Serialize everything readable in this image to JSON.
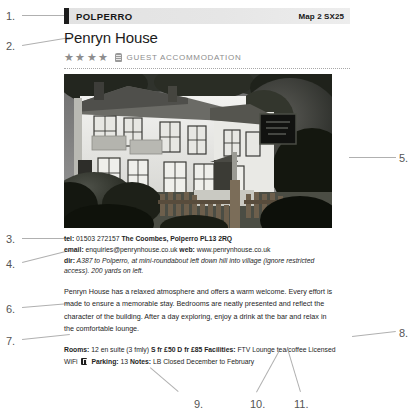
{
  "entry": {
    "town": "POLPERRO",
    "map_reference": "Map 2 SX25",
    "name": "Penryn House",
    "star_rating": 4,
    "stars_glyphs": "★★★★",
    "emblem_icon": "rosette-emblem-icon",
    "classification": "GUEST ACCOMMODATION",
    "photo_alt": "Black and white photograph of Penryn House, a white rendered Victorian guest house with bay windows, behind a wooden picket fence and hedge, with a dark sign board to the right",
    "contact": {
      "tel_label": "tel:",
      "tel_number": "01503 272157",
      "address": "The Coombes, Polperro PL13 2RQ",
      "email_label": "email:",
      "email": "enquiries@penrynhouse.co.uk",
      "web_label": "web:",
      "web": "www.penrynhouse.co.uk",
      "dir_label": "dir:",
      "directions": "A387 to Polperro, at mini-roundabout left down hill into village (ignore restricted access). 200 yards on left."
    },
    "description": "Penryn House has a relaxed atmosphere and offers a warm welcome. Every effort is made to ensure a memorable stay. Bedrooms are neatly presented and reflect the character of the building. After a day exploring, enjoy a drink at the bar and relax in the comfortable lounge.",
    "facilities": {
      "rooms_label": "Rooms:",
      "rooms_value": "12 en suite (3 fmly)",
      "single_rate": "S fr £50",
      "double_rate": "D fr £85",
      "facilities_label": "Facilities:",
      "facilities_value": "FTV Lounge tea/coffee Licensed WiFi",
      "parking_icon": "parking-icon",
      "parking_label": "Parking:",
      "parking_value": "13",
      "notes_label": "Notes:",
      "notes_value": "LB Closed December to February"
    }
  },
  "callouts": [
    {
      "id": "1",
      "label": "1.",
      "x": 6,
      "y": 10
    },
    {
      "id": "2",
      "label": "2.",
      "x": 6,
      "y": 40
    },
    {
      "id": "3",
      "label": "3.",
      "x": 6,
      "y": 233
    },
    {
      "id": "4",
      "label": "4.",
      "x": 6,
      "y": 258
    },
    {
      "id": "5",
      "label": "5.",
      "x": 399,
      "y": 152
    },
    {
      "id": "6",
      "label": "6.",
      "x": 6,
      "y": 303
    },
    {
      "id": "7",
      "label": "7.",
      "x": 6,
      "y": 335
    },
    {
      "id": "8",
      "label": "8.",
      "x": 399,
      "y": 327
    },
    {
      "id": "9",
      "label": "9.",
      "x": 194,
      "y": 398
    },
    {
      "id": "10",
      "label": "10.",
      "x": 250,
      "y": 398
    },
    {
      "id": "11",
      "label": "11.",
      "x": 294,
      "y": 398
    }
  ],
  "leaders": [
    {
      "name": "leader-1",
      "x1": 22,
      "y1": 15,
      "x2": 68,
      "y2": 15
    },
    {
      "name": "leader-2",
      "x1": 22,
      "y1": 45,
      "x2": 70,
      "y2": 37
    },
    {
      "name": "leader-3",
      "x1": 22,
      "y1": 238,
      "x2": 70,
      "y2": 238
    },
    {
      "name": "leader-4",
      "x1": 22,
      "y1": 262,
      "x2": 70,
      "y2": 250
    },
    {
      "name": "leader-5",
      "x1": 349,
      "y1": 157,
      "x2": 396,
      "y2": 157
    },
    {
      "name": "leader-6",
      "x1": 22,
      "y1": 307,
      "x2": 70,
      "y2": 303
    },
    {
      "name": "leader-7",
      "x1": 22,
      "y1": 339,
      "x2": 70,
      "y2": 334
    },
    {
      "name": "leader-8",
      "x1": 352,
      "y1": 336,
      "x2": 396,
      "y2": 331
    },
    {
      "name": "leader-9",
      "x1": 178,
      "y1": 392,
      "x2": 150,
      "y2": 368
    },
    {
      "name": "leader-10",
      "x1": 256,
      "y1": 392,
      "x2": 278,
      "y2": 352
    },
    {
      "name": "leader-11",
      "x1": 300,
      "y1": 392,
      "x2": 288,
      "y2": 352
    }
  ]
}
